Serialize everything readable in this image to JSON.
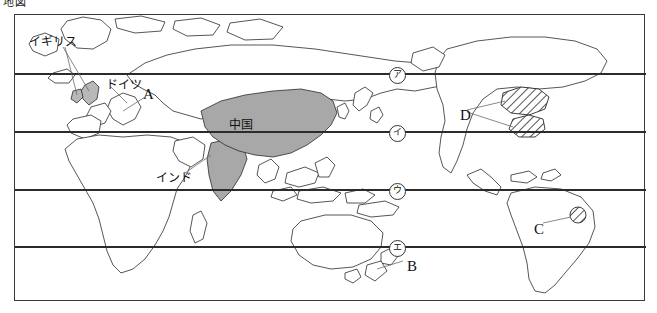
{
  "sheet": {
    "title": "地図"
  },
  "map": {
    "frame": {
      "x": 14,
      "y": 14,
      "width": 631,
      "height": 287
    },
    "projection_note": "world-map-outline",
    "latitude_lines_y": [
      73,
      131,
      189,
      246
    ],
    "shaded_countries": [
      {
        "name": "中国",
        "style": "solid-gray"
      },
      {
        "name": "ドイツ",
        "style": "solid-gray"
      },
      {
        "name": "インド",
        "style": "solid-gray"
      }
    ],
    "hatched_regions": [
      {
        "marker": "D",
        "style": "diagonal-hatch"
      },
      {
        "marker": "C",
        "style": "diagonal-hatch"
      }
    ]
  },
  "country_labels": [
    {
      "id": "uk",
      "text": "イギリス",
      "x": 28,
      "y": 35,
      "leader": true
    },
    {
      "id": "germany",
      "text": "ドイツ",
      "x": 105,
      "y": 78,
      "leader": true
    },
    {
      "id": "china",
      "text": "中国",
      "x": 228,
      "y": 118,
      "leader": false
    },
    {
      "id": "india",
      "text": "インド",
      "x": 155,
      "y": 171,
      "leader": true
    }
  ],
  "marker_letters": [
    {
      "id": "A",
      "text": "A",
      "x": 142,
      "y": 86,
      "points_to": "ドイツ"
    },
    {
      "id": "B",
      "text": "B",
      "x": 406,
      "y": 258,
      "points_to": "ニュージーランド"
    },
    {
      "id": "C",
      "text": "C",
      "x": 533,
      "y": 221,
      "points_to": "南アメリカ・ハッチ地域"
    },
    {
      "id": "D",
      "text": "D",
      "x": 459,
      "y": 107,
      "points_to": "北アメリカ・ハッチ地域"
    }
  ],
  "latitude_markers": [
    {
      "id": "mark-a",
      "text": "ア",
      "x": 388,
      "y": 66
    },
    {
      "id": "mark-i",
      "text": "イ",
      "x": 388,
      "y": 124
    },
    {
      "id": "mark-u",
      "text": "ウ",
      "x": 388,
      "y": 182
    },
    {
      "id": "mark-e",
      "text": "エ",
      "x": 388,
      "y": 239
    }
  ],
  "colors": {
    "shade_fill": "#a8a8a8",
    "outline": "#2b2b2b",
    "frame": "#3a3a3a",
    "latitude_line": "#2b2b2b",
    "leader_line": "#6b6b6b",
    "background": "#ffffff"
  }
}
